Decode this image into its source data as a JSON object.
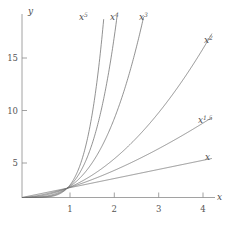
{
  "chart_data": {
    "type": "line",
    "title": "",
    "subtitle": "",
    "xlabel": "x",
    "ylabel": "y",
    "xlim": [
      0,
      4.35
    ],
    "ylim": [
      0,
      18.5
    ],
    "grid": false,
    "legend_position": "inline-curve-end-labels",
    "x_ticks": [
      1,
      2,
      3,
      4
    ],
    "x_tick_labels": [
      "1",
      "2",
      "3",
      "4"
    ],
    "y_ticks": [
      5,
      10,
      15
    ],
    "y_tick_labels": [
      "5",
      "10",
      "15"
    ],
    "annotations": [
      {
        "text": "x^5",
        "base": "x",
        "exponent": "5",
        "at_x": 1.82,
        "at_y": 18.0
      },
      {
        "text": "x^4",
        "base": "x",
        "exponent": "4",
        "at_x": 2.2,
        "at_y": 18.0
      },
      {
        "text": "x^3",
        "base": "x",
        "exponent": "3",
        "at_x": 2.62,
        "at_y": 18.0
      },
      {
        "text": "x^2",
        "base": "x",
        "exponent": "2",
        "at_x": 4.0,
        "at_y": 16.0
      },
      {
        "text": "x^1.5",
        "base": "x",
        "exponent": "1.5",
        "at_x": 4.0,
        "at_y": 8.0
      },
      {
        "text": "x",
        "base": "x",
        "exponent": "",
        "at_x": 4.0,
        "at_y": 4.0
      }
    ],
    "series": [
      {
        "name": "x",
        "exponent": 1,
        "color": "#6e6e6e",
        "x": [
          0,
          0.25,
          0.5,
          0.75,
          1,
          1.5,
          2,
          2.5,
          3,
          3.5,
          4
        ],
        "values": [
          0,
          0.25,
          0.5,
          0.75,
          1,
          1.5,
          2,
          2.5,
          3,
          3.5,
          4
        ]
      },
      {
        "name": "x^1.5",
        "exponent": 1.5,
        "color": "#6e6e6e",
        "x": [
          0,
          0.25,
          0.5,
          0.75,
          1,
          1.5,
          2,
          2.5,
          3,
          3.5,
          4
        ],
        "values": [
          0,
          0.125,
          0.354,
          0.65,
          1,
          1.837,
          2.828,
          3.953,
          5.196,
          6.548,
          8.0
        ]
      },
      {
        "name": "x^2",
        "exponent": 2,
        "color": "#6e6e6e",
        "x": [
          0,
          0.25,
          0.5,
          0.75,
          1,
          1.5,
          2,
          2.5,
          3,
          3.5,
          4
        ],
        "values": [
          0,
          0.0625,
          0.25,
          0.5625,
          1,
          2.25,
          4,
          6.25,
          9,
          12.25,
          16
        ]
      },
      {
        "name": "x^3",
        "exponent": 3,
        "color": "#6e6e6e",
        "x": [
          0,
          0.25,
          0.5,
          0.75,
          1,
          1.25,
          1.5,
          1.75,
          2,
          2.25,
          2.47
        ],
        "values": [
          0,
          0.0156,
          0.125,
          0.4219,
          1,
          1.953,
          3.375,
          5.359,
          8,
          11.39,
          15.07
        ]
      },
      {
        "name": "x^4",
        "exponent": 4,
        "color": "#6e6e6e",
        "x": [
          0,
          0.25,
          0.5,
          0.75,
          1,
          1.25,
          1.5,
          1.75,
          2.0
        ],
        "values": [
          0,
          0.0039,
          0.0625,
          0.3164,
          1,
          2.441,
          5.063,
          9.379,
          16.0
        ]
      },
      {
        "name": "x^5",
        "exponent": 5,
        "color": "#6e6e6e",
        "x": [
          0,
          0.25,
          0.5,
          0.75,
          1,
          1.2,
          1.4,
          1.6,
          1.75
        ],
        "values": [
          0,
          0.001,
          0.031,
          0.237,
          1,
          2.488,
          5.378,
          10.486,
          16.41
        ]
      }
    ]
  },
  "axes": {
    "x_axis_label": "x",
    "y_axis_label": "y"
  }
}
